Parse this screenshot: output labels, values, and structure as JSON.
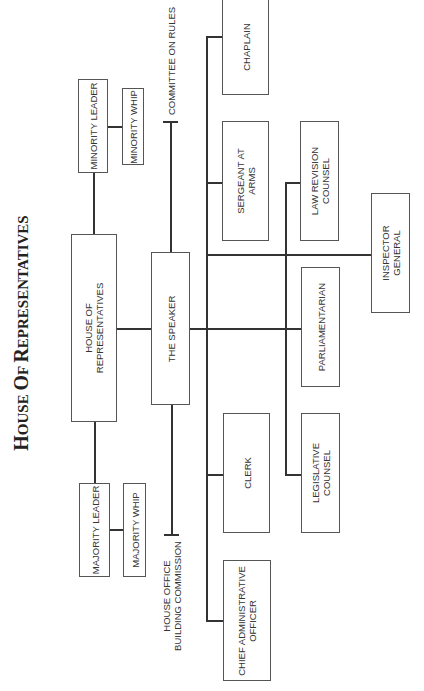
{
  "title": {
    "parts": [
      {
        "big": "H",
        "small": "OUSE "
      },
      {
        "big": "O",
        "small": "F "
      },
      {
        "big": "R",
        "small": "EPRESENTATIVES"
      }
    ],
    "full": "House Of Representatives"
  },
  "nodes": {
    "house": "HOUSE OF\nREPRESENTATIVES",
    "speaker": "THE SPEAKER",
    "minority_leader": "MINORITY LEADER",
    "minority_whip": "MINORITY WHIP",
    "majority_leader": "MAJORITY LEADER",
    "majority_whip": "MAJORITY WHIP",
    "committee_rules": "COMMITTEE ON RULES",
    "building_commission": "HOUSE OFFICE\nBUILDING COMMISSION",
    "chaplain": "CHAPLAIN",
    "sergeant": "SERGEANT AT\nARMS",
    "law_revision": "LAW REVISION\nCOUNSEL",
    "inspector": "INSPECTOR\nGENERAL",
    "parliamentarian": "PARLIAMENTARIAN",
    "clerk": "CLERK",
    "legislative": "LEGISLATIVE\nCOUNSEL",
    "cao": "CHIEF ADMINISTRATIVE\nOFFICER"
  },
  "colors": {
    "line": "#333333",
    "border": "#555555",
    "background": "#ffffff"
  }
}
